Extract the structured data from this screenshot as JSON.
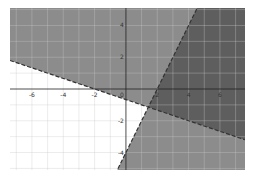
{
  "chart_data": {
    "type": "area",
    "title": "",
    "xlabel": "",
    "ylabel": "",
    "xlim": [
      -7.4,
      7.6
    ],
    "ylim": [
      -5.1,
      5.1
    ],
    "grid": true,
    "x_ticks": [
      -6,
      -4,
      -2,
      0,
      2,
      4,
      6
    ],
    "x_tick_labels": [
      "-6",
      "-4",
      "-2",
      "0",
      "2",
      "4",
      "6"
    ],
    "y_ticks": [
      4,
      2,
      -2,
      -4
    ],
    "y_tick_labels": [
      "4",
      "2",
      "-2",
      "-4"
    ],
    "series": [
      {
        "name": "boundary-1",
        "style": "dashed",
        "equation": "y = -x/3 - 2/3",
        "slope": -0.333,
        "intercept": -0.667,
        "shaded_side": "above"
      },
      {
        "name": "boundary-2",
        "style": "dashed",
        "equation": "y = 2x - 4",
        "slope": 2,
        "intercept": -4,
        "shaded_side": "below/right"
      }
    ],
    "intersection": [
      1.43,
      -1.14
    ],
    "colors": {
      "region_single": "#8c8c8c",
      "region_overlap": "#5e5e5e",
      "unshaded": "#ffffff",
      "grid": "#c8c8c8",
      "axis": "#222222"
    }
  }
}
